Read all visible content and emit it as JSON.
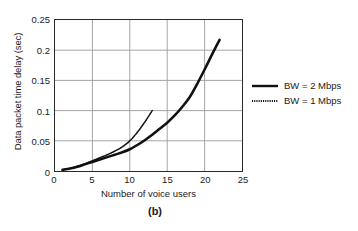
{
  "figure": {
    "caption": "(b)"
  },
  "chart_data": {
    "type": "line",
    "title": "",
    "subtitle": "",
    "xlabel": "Number of voice users",
    "ylabel": "Data packet time delay (sec)",
    "xlim": [
      0,
      25
    ],
    "ylim": [
      0,
      0.25
    ],
    "xticks": [
      0,
      5,
      10,
      15,
      20,
      25
    ],
    "xtick_labels": [
      "0",
      "5",
      "10",
      "15",
      "20",
      "25"
    ],
    "yticks": [
      0,
      0.05,
      0.1,
      0.15,
      0.2,
      0.25
    ],
    "ytick_labels": [
      "0",
      "0.05",
      "0.1",
      "0.15",
      "0.2",
      "0.25"
    ],
    "grid": true,
    "grid_color": "#9a9a9a",
    "axis_color": "#2a2a2a",
    "legend_position": "right-outside",
    "series": [
      {
        "name": "BW = 2 Mbps",
        "style": "solid",
        "color": "#111111",
        "width": 2.6,
        "x": [
          1,
          2,
          3,
          4,
          5,
          6,
          7,
          8,
          9,
          10,
          11,
          12,
          13,
          14,
          15,
          16,
          17,
          18,
          19,
          20,
          21,
          22
        ],
        "y": [
          0.002,
          0.004,
          0.007,
          0.011,
          0.015,
          0.019,
          0.023,
          0.027,
          0.031,
          0.036,
          0.043,
          0.051,
          0.06,
          0.07,
          0.08,
          0.092,
          0.106,
          0.122,
          0.144,
          0.168,
          0.193,
          0.217
        ]
      },
      {
        "name": "BW = 1 Mbps",
        "style": "dotted",
        "color": "#111111",
        "width": 1.6,
        "x": [
          1,
          2,
          3,
          4,
          5,
          6,
          7,
          8,
          9,
          10,
          11,
          12,
          13
        ],
        "y": [
          0.002,
          0.004,
          0.008,
          0.012,
          0.017,
          0.022,
          0.027,
          0.033,
          0.04,
          0.05,
          0.064,
          0.081,
          0.1
        ]
      }
    ]
  },
  "legend": {
    "items": [
      {
        "label": "BW = 2 Mbps",
        "style": "solid"
      },
      {
        "label": "BW = 1 Mbps",
        "style": "dotted"
      }
    ]
  }
}
